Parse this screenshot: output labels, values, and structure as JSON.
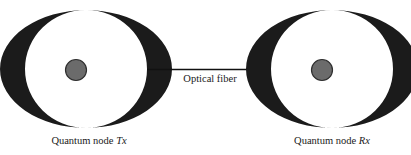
{
  "figure": {
    "background_color": "#ffffff"
  },
  "nodes": [
    {
      "id": "tx",
      "label_prefix": "Quantum node ",
      "label_emphasis": "Tx",
      "cavity_color": "#1b1b1b",
      "atom_fill": "#6b6b6b",
      "atom_stroke": "#2e2e2e",
      "center_x": 86,
      "center_y": 70
    },
    {
      "id": "rx",
      "label_prefix": "Quantum node ",
      "label_emphasis": "Rx",
      "cavity_color": "#1b1b1b",
      "atom_fill": "#6b6b6b",
      "atom_stroke": "#2e2e2e",
      "center_x": 332,
      "center_y": 70
    }
  ],
  "link": {
    "label": "Optical fiber",
    "color": "#111111",
    "x_start": 147,
    "x_end": 271,
    "y": 69.5,
    "thickness": 1.4
  }
}
